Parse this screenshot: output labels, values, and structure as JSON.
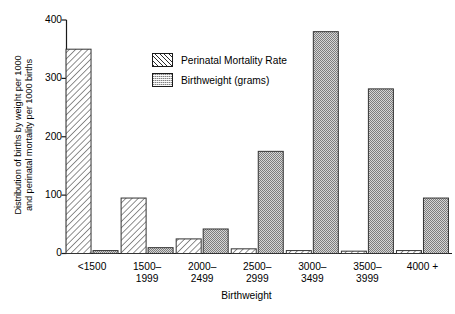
{
  "chart_data": {
    "type": "bar",
    "title": "",
    "xlabel": "Birthweight",
    "ylabel": "Distribution of births by weight per 1000 and perinatal mortality per 1000 births",
    "ylabel_line1": "Distribution of births by weight per 1000",
    "ylabel_line2": "and perinatal mortality per 1000 births",
    "ylim": [
      0,
      400
    ],
    "yticks": [
      0,
      100,
      200,
      300,
      400
    ],
    "ytick_labels": [
      "0",
      "100",
      "200",
      "300",
      "400"
    ],
    "grid": false,
    "legend_position": "upper-left-inside",
    "categories": [
      "<1500",
      "1500–\n1999",
      "2000–\n2499",
      "2500–\n2999",
      "3000–\n3499",
      "3500–\n3999",
      "4000 +"
    ],
    "series": [
      {
        "name": "Perinatal Mortality Rate",
        "fill": "diagonal-hatch",
        "values": [
          350,
          95,
          25,
          8,
          5,
          4,
          5
        ]
      },
      {
        "name": "Birthweight (grams)",
        "fill": "stipple-dots",
        "values": [
          5,
          10,
          42,
          175,
          380,
          282,
          95
        ]
      }
    ]
  },
  "legend": {
    "items": [
      {
        "label": "Perinatal Mortality Rate",
        "swatch": "hatch-swatch"
      },
      {
        "label": "Birthweight (grams)",
        "swatch": "dot-swatch"
      }
    ]
  },
  "colors": {
    "axis": "#1a1a1a",
    "hatch_line": "#2b2b2b",
    "dot_fill": "#c9c9c9",
    "bar_outline": "#333333",
    "background": "#ffffff"
  }
}
